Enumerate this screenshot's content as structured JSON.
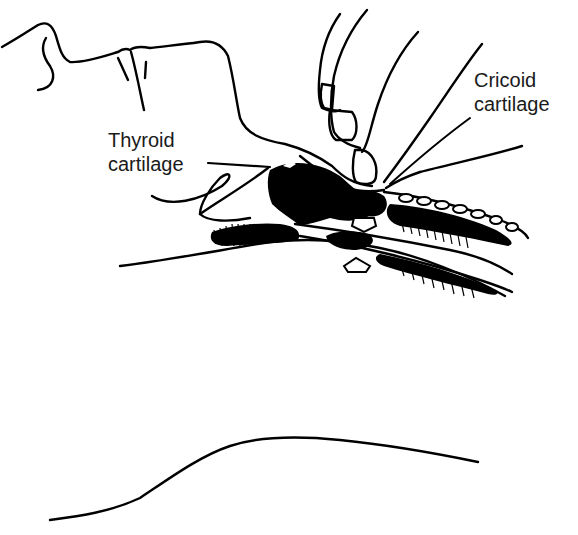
{
  "figure": {
    "labels": {
      "thyroid": {
        "line1": "Thyroid",
        "line2": "cartilage"
      },
      "cricoid": {
        "line1": "Cricoid",
        "line2": "cartilage"
      }
    },
    "arrows": [
      {
        "name": "downward-pressure-arrow",
        "direction": "down"
      },
      {
        "name": "upward-counter-arrow",
        "direction": "up"
      }
    ],
    "colors": {
      "ink": "#000000",
      "background": "#ffffff",
      "text": "#1a1a1a"
    }
  }
}
